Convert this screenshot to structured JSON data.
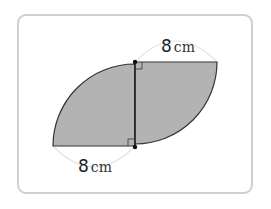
{
  "figure": {
    "top_label": {
      "value": "8",
      "unit": "cm"
    },
    "bottom_label": {
      "value": "8",
      "unit": "cm"
    },
    "colors": {
      "fill": "#b3b3b3",
      "stroke": "#333333",
      "frame": "#cfcfcf",
      "dimension_arc": "#e3e3e3"
    },
    "right_angle_marks": 2,
    "points": 2
  }
}
